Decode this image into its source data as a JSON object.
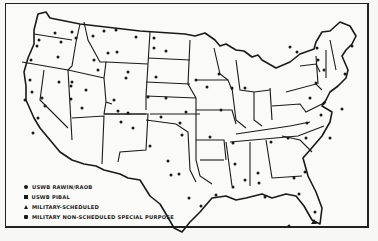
{
  "map": {
    "title": "",
    "region": "Conterminous United States",
    "ink_color": "#1a1a1a",
    "paper_color": "#fafaf8"
  },
  "legend": {
    "items": [
      {
        "symbol": "circle",
        "label": "USWB RAWIN/RAOB"
      },
      {
        "symbol": "square",
        "label": "USWB PIBAL"
      },
      {
        "symbol": "triangle",
        "label": "MILITARY-SCHEDULED"
      },
      {
        "symbol": "hex",
        "label": "MILITARY NON-SCHEDULED SPECIAL PURPOSE"
      }
    ]
  },
  "stations": [
    [
      55,
      33
    ],
    [
      39,
      40
    ],
    [
      37,
      46
    ],
    [
      61,
      42
    ],
    [
      72,
      32
    ],
    [
      76,
      38
    ],
    [
      93,
      36
    ],
    [
      104,
      31
    ],
    [
      116,
      30
    ],
    [
      136,
      37
    ],
    [
      154,
      38
    ],
    [
      166,
      51
    ],
    [
      154,
      48
    ],
    [
      108,
      53
    ],
    [
      117,
      52
    ],
    [
      94,
      60
    ],
    [
      98,
      70
    ],
    [
      126,
      78
    ],
    [
      128,
      72
    ],
    [
      58,
      57
    ],
    [
      31,
      60
    ],
    [
      30,
      80
    ],
    [
      32,
      92
    ],
    [
      25,
      100
    ],
    [
      42,
      98
    ],
    [
      45,
      106
    ],
    [
      38,
      118
    ],
    [
      33,
      133
    ],
    [
      72,
      82
    ],
    [
      59,
      82
    ],
    [
      71,
      86
    ],
    [
      71,
      99
    ],
    [
      86,
      90
    ],
    [
      82,
      108
    ],
    [
      114,
      100
    ],
    [
      118,
      111
    ],
    [
      128,
      113
    ],
    [
      121,
      122
    ],
    [
      133,
      128
    ],
    [
      161,
      117
    ],
    [
      148,
      97
    ],
    [
      156,
      77
    ],
    [
      166,
      98
    ],
    [
      180,
      123
    ],
    [
      182,
      135
    ],
    [
      150,
      146
    ],
    [
      168,
      161
    ],
    [
      171,
      175
    ],
    [
      179,
      174
    ],
    [
      186,
      112
    ],
    [
      196,
      80
    ],
    [
      207,
      87
    ],
    [
      219,
      74
    ],
    [
      232,
      88
    ],
    [
      245,
      88
    ],
    [
      221,
      110
    ],
    [
      210,
      137
    ],
    [
      233,
      143
    ],
    [
      235,
      164
    ],
    [
      245,
      180
    ],
    [
      216,
      195
    ],
    [
      259,
      183
    ],
    [
      265,
      197
    ],
    [
      258,
      173
    ],
    [
      271,
      142
    ],
    [
      288,
      138
    ],
    [
      306,
      138
    ],
    [
      307,
      123
    ],
    [
      324,
      103
    ],
    [
      342,
      109
    ],
    [
      316,
      83
    ],
    [
      318,
      60
    ],
    [
      324,
      70
    ],
    [
      345,
      74
    ],
    [
      352,
      46
    ],
    [
      317,
      48
    ],
    [
      297,
      52
    ],
    [
      290,
      47
    ],
    [
      310,
      98
    ],
    [
      321,
      115
    ],
    [
      294,
      178
    ],
    [
      305,
      172
    ],
    [
      299,
      194
    ],
    [
      330,
      138
    ],
    [
      315,
      212
    ],
    [
      289,
      226
    ],
    [
      189,
      198
    ],
    [
      201,
      206
    ],
    [
      233,
      187
    ]
  ]
}
